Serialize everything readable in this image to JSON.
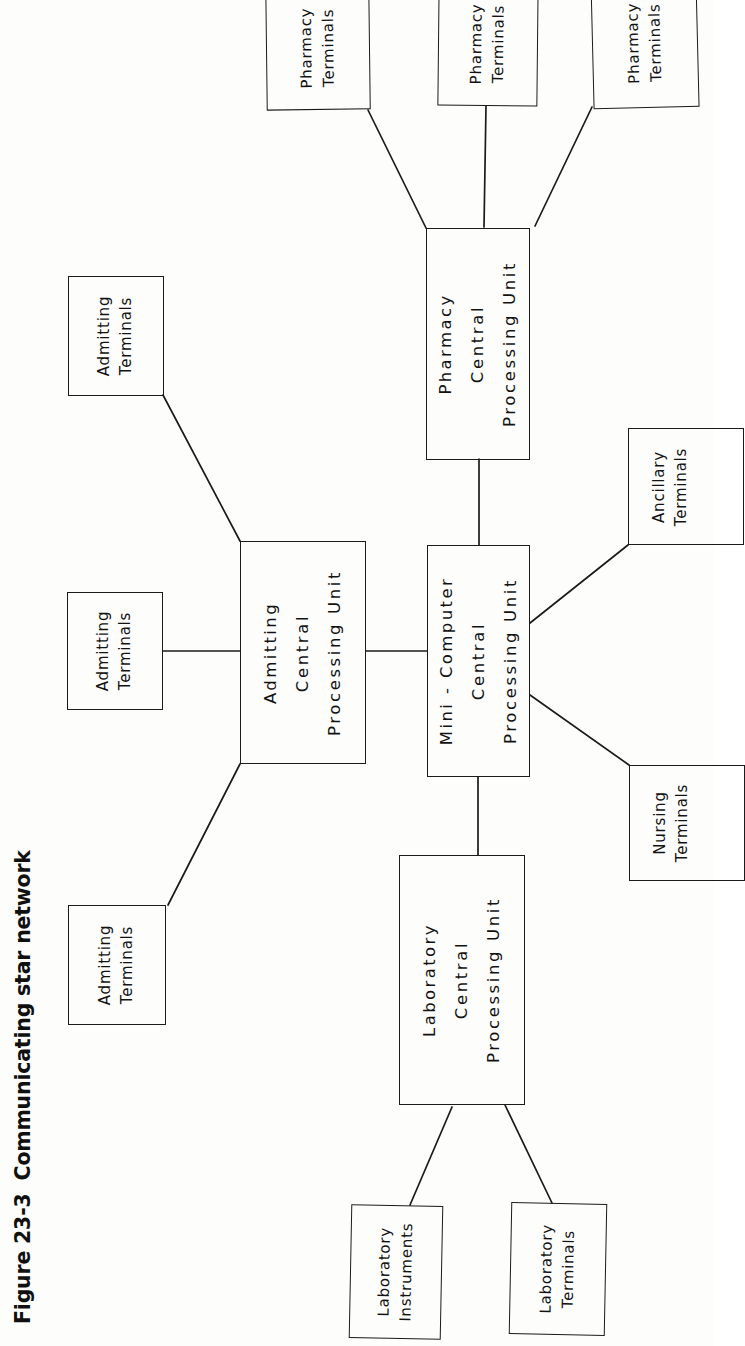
{
  "figure": {
    "number": "Figure 23-3",
    "title": "Communicating star network",
    "orientation": "rotated-90-ccw"
  },
  "colors": {
    "ink": "#1b1b1b",
    "text": "#121212",
    "background": "#fdfdfc"
  },
  "diagram": {
    "type": "star-network",
    "nodes": {
      "pharmacy_terminals_1": {
        "line1": "Pharmacy",
        "line2": "Terminals"
      },
      "pharmacy_terminals_2": {
        "line1": "Pharmacy",
        "line2": "Terminals"
      },
      "pharmacy_terminals_3": {
        "line1": "Pharmacy",
        "line2": "Terminals"
      },
      "pharmacy_cpu": {
        "line1": "Pharmacy",
        "line2": "Central",
        "line3": "Processing Unit"
      },
      "admitting_terminals_1": {
        "line1": "Admitting",
        "line2": "Terminals"
      },
      "admitting_terminals_2": {
        "line1": "Admitting",
        "line2": "Terminals"
      },
      "admitting_terminals_3": {
        "line1": "Admitting",
        "line2": "Terminals"
      },
      "admitting_cpu": {
        "line1": "Admitting",
        "line2": "Central",
        "line3": "Processing Unit"
      },
      "mini_computer_cpu": {
        "line1": "Mini - Computer",
        "line2": "Central",
        "line3": "Processing Unit"
      },
      "ancillary_terminals": {
        "line1": "Ancillary",
        "line2": "Terminals"
      },
      "nursing_terminals": {
        "line1": "Nursing",
        "line2": "Terminals"
      },
      "laboratory_cpu": {
        "line1": "Laboratory",
        "line2": "Central",
        "line3": "Processing Unit"
      },
      "laboratory_instruments": {
        "line1": "Laboratory",
        "line2": "Instruments"
      },
      "laboratory_terminals": {
        "line1": "Laboratory",
        "line2": "Terminals"
      }
    },
    "edges": [
      {
        "from": "pharmacy_cpu",
        "to": "pharmacy_terminals_1"
      },
      {
        "from": "pharmacy_cpu",
        "to": "pharmacy_terminals_2"
      },
      {
        "from": "pharmacy_cpu",
        "to": "pharmacy_terminals_3"
      },
      {
        "from": "mini_computer_cpu",
        "to": "pharmacy_cpu"
      },
      {
        "from": "admitting_cpu",
        "to": "admitting_terminals_1"
      },
      {
        "from": "admitting_cpu",
        "to": "admitting_terminals_2"
      },
      {
        "from": "admitting_cpu",
        "to": "admitting_terminals_3"
      },
      {
        "from": "mini_computer_cpu",
        "to": "admitting_cpu"
      },
      {
        "from": "mini_computer_cpu",
        "to": "ancillary_terminals"
      },
      {
        "from": "mini_computer_cpu",
        "to": "nursing_terminals"
      },
      {
        "from": "mini_computer_cpu",
        "to": "laboratory_cpu"
      },
      {
        "from": "laboratory_cpu",
        "to": "laboratory_instruments"
      },
      {
        "from": "laboratory_cpu",
        "to": "laboratory_terminals"
      }
    ]
  }
}
